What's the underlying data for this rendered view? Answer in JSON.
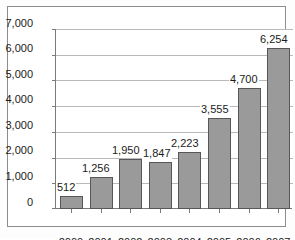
{
  "chart_data": {
    "type": "bar",
    "title": "",
    "subtitle": "",
    "xlabel": "",
    "ylabel": "",
    "categories": [
      "2000",
      "2001",
      "2002",
      "2003",
      "2004",
      "2005",
      "2006",
      "2007"
    ],
    "values": [
      512,
      1256,
      1950,
      1847,
      2223,
      3555,
      4700,
      6254
    ],
    "value_labels": [
      "512",
      "1,256",
      "1,950",
      "1,847",
      "2,223",
      "3,555",
      "4,700",
      "6,254"
    ],
    "ylim": [
      0,
      7000
    ],
    "ytick_values": [
      0,
      1000,
      2000,
      3000,
      4000,
      5000,
      6000,
      7000
    ],
    "ytick_labels": [
      "0",
      "1,000",
      "2,000",
      "3,000",
      "4,000",
      "5,000",
      "6,000",
      "7,000"
    ],
    "grid": true,
    "legend": "none",
    "legend_position": "none",
    "series": [
      {
        "name": "",
        "values": [
          512,
          1256,
          1950,
          1847,
          2223,
          3555,
          4700,
          6254
        ]
      }
    ],
    "colors": {
      "bar_fill": "#9a9a9a",
      "bar_border": "#575757",
      "gridline": "#b9b9b9",
      "axis": "#7a7a7a",
      "text": "#1b1b1b",
      "frame": "#8d8d8d",
      "background": "#ffffff"
    }
  }
}
